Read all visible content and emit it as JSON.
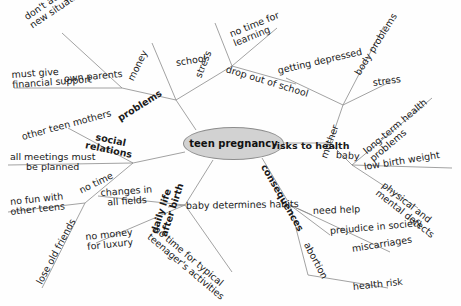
{
  "diagram": {
    "type": "mind-map",
    "title": "teen pregnancy",
    "background_color": "#fefefe",
    "center_fill": "#d2d2d2",
    "center_stroke": "#8d8d8d",
    "line_color": "#8a8a8a",
    "text_color": "#1a1a1a"
  },
  "center": {
    "label": "teen pregnancy"
  },
  "branches": [
    {
      "label": "problems",
      "children": [
        {
          "label": "own parents",
          "children": [
            {
              "label_line1": "don't accept the",
              "label_line2": "new situation"
            },
            {
              "label_line1": "must give",
              "label_line2": "financial support"
            }
          ]
        },
        {
          "label": "money",
          "children": []
        },
        {
          "label": "school",
          "children": [
            {
              "label_line1": "stress",
              "label_line2": ""
            },
            {
              "label_line1": "no time for",
              "label_line2": "learning"
            },
            {
              "label_line1": "drop out of school",
              "label_line2": ""
            }
          ]
        }
      ]
    },
    {
      "label": "risks to health",
      "children": [
        {
          "label": "mother",
          "children": [
            {
              "label_line1": "getting depressed",
              "label_line2": ""
            },
            {
              "label_line1": "body problems",
              "label_line2": ""
            },
            {
              "label_line1": "stress",
              "label_line2": ""
            }
          ]
        },
        {
          "label": "baby",
          "children": [
            {
              "label_line1": "long-term health",
              "label_line2": "problems"
            },
            {
              "label_line1": "low birth weight",
              "label_line2": ""
            },
            {
              "label_line1": "physical and",
              "label_line2": "mental defects"
            }
          ]
        }
      ]
    },
    {
      "label": "consequences",
      "children": [
        {
          "label": "need help",
          "children": []
        },
        {
          "label": "prejudice in society",
          "children": []
        },
        {
          "label": "miscarriages",
          "children": []
        },
        {
          "label": "abortion",
          "children": [
            {
              "label_line1": "health risk",
              "label_line2": ""
            }
          ]
        }
      ]
    },
    {
      "label_line1": "daily life",
      "label_line2": "after birth",
      "children": [
        {
          "label": "baby determines habits",
          "children": []
        },
        {
          "label_line1": "no time for typical",
          "label_line2": "teenager's activities"
        },
        {
          "label_line1": "changes in",
          "label_line2": "all fields"
        },
        {
          "label_line1": "no money",
          "label_line2": "for luxury"
        }
      ]
    },
    {
      "label_line1": "social",
      "label_line2": "relations",
      "children": [
        {
          "label_line1": "other teen mothers",
          "label_line2": ""
        },
        {
          "label_line1": "all meetings must",
          "label_line2": "be planned"
        },
        {
          "label": "no time",
          "children": [
            {
              "label_line1": "no fun with",
              "label_line2": "other teens"
            },
            {
              "label_line1": "lose old friends",
              "label_line2": ""
            }
          ]
        }
      ]
    }
  ],
  "labels": {
    "center": "teen pregnancy",
    "problems": "problems",
    "risks_to_health": "risks to health",
    "consequences": "consequences",
    "daily_life_1": "daily life",
    "daily_life_2": "after birth",
    "social_1": "social",
    "social_2": "relations",
    "own_parents": "own parents",
    "dont_accept_1": "don't accept the",
    "dont_accept_2": "new situation",
    "must_give_1": "must give",
    "must_give_2": "financial support",
    "money": "money",
    "school": "school",
    "stress_school": "stress",
    "no_time_learning_1": "no time for",
    "no_time_learning_2": "learning",
    "drop_out": "drop out of school",
    "mother": "mother",
    "getting_depressed": "getting depressed",
    "body_problems": "body problems",
    "stress_mother": "stress",
    "baby": "baby",
    "long_term_1": "long-term health",
    "long_term_2": "problems",
    "low_birth_weight": "low birth weight",
    "physical_1": "physical and",
    "physical_2": "mental defects",
    "need_help": "need help",
    "prejudice": "prejudice in society",
    "miscarriages": "miscarriages",
    "abortion": "abortion",
    "health_risk": "health risk",
    "baby_determines": "baby determines habits",
    "no_time_typical_1": "no time for typical",
    "no_time_typical_2": "teenager's activities",
    "changes_1": "changes in",
    "changes_2": "all fields",
    "no_money_1": "no money",
    "no_money_2": "for luxury",
    "other_teen_mothers": "other teen mothers",
    "all_meetings_1": "all meetings must",
    "all_meetings_2": "be planned",
    "no_time": "no time",
    "no_fun_1": "no fun with",
    "no_fun_2": "other teens",
    "lose_old_friends": "lose old friends"
  }
}
